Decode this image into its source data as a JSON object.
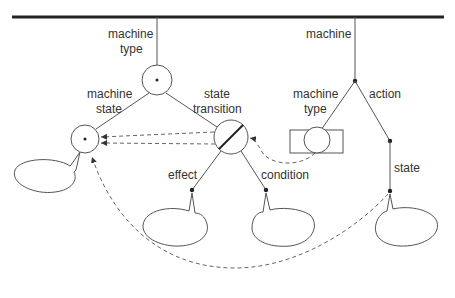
{
  "diagram": {
    "type": "object-structure-tree",
    "colors": {
      "line": "#555555",
      "bar": "#222222",
      "text": "#333333",
      "background": "#ffffff"
    },
    "labels": {
      "machine_type_top": [
        "machine",
        "type"
      ],
      "machine_state": [
        "machine",
        "state"
      ],
      "state_transition": [
        "state",
        "transition"
      ],
      "machine": "machine",
      "machine_type_right": [
        "machine",
        "type"
      ],
      "action": "action",
      "effect": "effect",
      "condition": "condition",
      "state": "state"
    },
    "nodes": [
      {
        "id": "machine-type-node",
        "kind": "circle-with-dot"
      },
      {
        "id": "machine-state-node",
        "kind": "circle-with-dot"
      },
      {
        "id": "state-transition-node",
        "kind": "circle-with-slash"
      },
      {
        "id": "machine-root-dot",
        "kind": "dot"
      },
      {
        "id": "machine-type-box",
        "kind": "rectangle-with-circle"
      },
      {
        "id": "action-dot",
        "kind": "dot"
      },
      {
        "id": "state-dot",
        "kind": "dot"
      },
      {
        "id": "effect-dot",
        "kind": "dot"
      },
      {
        "id": "condition-dot",
        "kind": "dot"
      }
    ],
    "bubbles": [
      "machine-state-bubble",
      "effect-bubble",
      "condition-bubble",
      "state-bubble"
    ],
    "references": [
      {
        "from": "state-transition-node",
        "to": "machine-state-node",
        "style": "dashed"
      },
      {
        "from": "state-transition-node",
        "to": "machine-state-node",
        "style": "dashed"
      },
      {
        "from": "machine-type-box",
        "to": "state-transition-node",
        "style": "dashed"
      },
      {
        "from": "state-dot",
        "to": "machine-state-node",
        "style": "dashed"
      }
    ]
  }
}
